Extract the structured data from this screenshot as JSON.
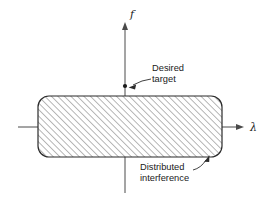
{
  "figure": {
    "background_color": "#ffffff",
    "axes": {
      "vertical": {
        "label": "f",
        "label_x": 130,
        "label_y": 18,
        "x": 125,
        "y_top": 22,
        "y_bottom": 193,
        "color": "#4a4a4a",
        "arrow": "up"
      },
      "horizontal": {
        "label": "λ",
        "label_x": 250,
        "label_y": 131,
        "y": 127,
        "x_left": 18,
        "x_right": 244,
        "color": "#4a4a4a",
        "arrow": "right"
      }
    },
    "region": {
      "name": "distributed-interference-region",
      "x": 38,
      "y": 96,
      "width": 184,
      "height": 61,
      "corner_radius": 11,
      "stroke_color": "#2b2b2b",
      "hatch_angle_deg": 45,
      "hatch_spacing": 3.2,
      "hatch_color": "#555555",
      "fill_color": "#ffffff"
    },
    "target_point": {
      "name": "desired-target-point",
      "x": 125,
      "y": 86,
      "radius": 2.1,
      "color": "#1a1a1a"
    },
    "callouts": [
      {
        "id": "desired-target",
        "lines": [
          "Desired",
          "target"
        ],
        "text_x": 152,
        "text_y": 71,
        "line_height": 10.5,
        "leader": {
          "from_x": 150,
          "from_y": 80,
          "to_x": 129,
          "to_y": 87,
          "arrow": "to-point"
        }
      },
      {
        "id": "distributed-interference",
        "lines": [
          "Distributed",
          "interference"
        ],
        "text_x": 140,
        "text_y": 170,
        "line_height": 10.8,
        "leader": {
          "from_x": 196,
          "from_y": 169,
          "to_x": 209,
          "to_y": 156,
          "arrow": "to-region"
        }
      }
    ]
  }
}
